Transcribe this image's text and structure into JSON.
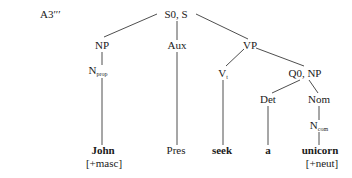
{
  "diagram_label": "A3′′′",
  "nodes": {
    "root": {
      "label": "S0, S"
    },
    "np1": {
      "label": "NP"
    },
    "aux": {
      "label": "Aux"
    },
    "vp": {
      "label": "VP"
    },
    "nprop": {
      "label": "N",
      "sub": "prop"
    },
    "vt": {
      "label": "V",
      "sub": "t"
    },
    "qnp": {
      "label": "Q0, NP"
    },
    "det": {
      "label": "Det"
    },
    "nom": {
      "label": "Nom"
    },
    "ncom": {
      "label": "N",
      "sub": "com"
    }
  },
  "leaves": {
    "john": {
      "word": "John",
      "feature": "[+masc]"
    },
    "pres": {
      "word": "Pres"
    },
    "seek": {
      "word": "seek"
    },
    "a": {
      "word": "a"
    },
    "unicorn": {
      "word": "unicorn",
      "feature": "[+neut]"
    }
  },
  "edges": [
    [
      "root",
      "np1"
    ],
    [
      "root",
      "aux"
    ],
    [
      "root",
      "vp"
    ],
    [
      "np1",
      "nprop"
    ],
    [
      "nprop",
      "john"
    ],
    [
      "aux",
      "pres"
    ],
    [
      "vp",
      "vt"
    ],
    [
      "vp",
      "qnp"
    ],
    [
      "vt",
      "seek"
    ],
    [
      "qnp",
      "det"
    ],
    [
      "qnp",
      "nom"
    ],
    [
      "det",
      "a"
    ],
    [
      "nom",
      "ncom"
    ],
    [
      "ncom",
      "unicorn"
    ]
  ]
}
